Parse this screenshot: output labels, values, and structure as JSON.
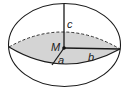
{
  "diagram": {
    "labels": {
      "center": "M",
      "semi_axis_a": "a",
      "semi_axis_b": "b",
      "semi_axis_c": "c"
    },
    "colors": {
      "stroke": "#1a1a1a",
      "equatorial_fill": "#d4d4d4",
      "background": "#ffffff"
    }
  }
}
